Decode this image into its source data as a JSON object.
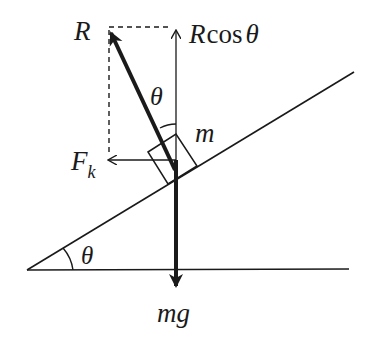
{
  "diagram": {
    "type": "free-body-diagram",
    "labels": {
      "reaction": "R",
      "reaction_vertical_prefix": "R",
      "reaction_vertical_func": "cos",
      "reaction_vertical_angle": "θ",
      "angle_at_block": "θ",
      "mass": "m",
      "friction_main": "F",
      "friction_sub": "k",
      "incline_angle": "θ",
      "weight": "mg"
    },
    "colors": {
      "stroke": "#1a1a1a",
      "background": "#ffffff"
    }
  }
}
